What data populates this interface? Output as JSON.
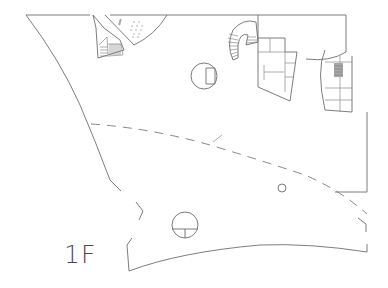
{
  "drawing": {
    "type": "architectural-floor-plan",
    "floor_label": "1F",
    "line_color": "#6e6e6e",
    "background": "#ffffff"
  },
  "elements": {
    "spiral_stair_top_left": "spiral-stair",
    "auditorium_wedge": "seating-area",
    "spiral_stair_center": "spiral-stair",
    "core_center": "service-core",
    "core_right": "service-core-with-stair",
    "round_column_upper": "circular-room",
    "round_column_lower": "circular-room",
    "small_column": "column",
    "dashed_line": "overhead-roof-edge"
  }
}
